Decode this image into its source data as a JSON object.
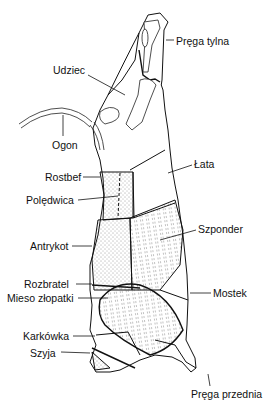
{
  "diagram": {
    "labels": [
      {
        "id": "prega-tylna",
        "text": "Pręga tylna",
        "x": 176,
        "y": 35
      },
      {
        "id": "udziec",
        "text": "Udziec",
        "x": 53,
        "y": 66
      },
      {
        "id": "ogon",
        "text": "Ogon",
        "x": 52,
        "y": 140
      },
      {
        "id": "lata",
        "text": "Łata",
        "x": 194,
        "y": 159
      },
      {
        "id": "rostbef",
        "text": "Rostbef",
        "x": 45,
        "y": 171
      },
      {
        "id": "poledwica",
        "text": "Polędwica",
        "x": 26,
        "y": 195
      },
      {
        "id": "szponder",
        "text": "Szponder",
        "x": 198,
        "y": 224
      },
      {
        "id": "antrykot",
        "text": "Antrykot",
        "x": 30,
        "y": 238
      },
      {
        "id": "rozbratel",
        "text": "Rozbratel",
        "x": 24,
        "y": 279
      },
      {
        "id": "mieso-z-lopatki",
        "text": "Mieso złopatki",
        "x": 7,
        "y": 293
      },
      {
        "id": "mostek",
        "text": "Mostek",
        "x": 213,
        "y": 288
      },
      {
        "id": "karkowka",
        "text": "Karkówka",
        "x": 23,
        "y": 331
      },
      {
        "id": "szyja",
        "text": "Szyja",
        "x": 30,
        "y": 348
      },
      {
        "id": "prega-przednia",
        "text": "Pręga przednia",
        "x": 191,
        "y": 389
      }
    ]
  },
  "colors": {
    "ink": "#111111",
    "background": "#ffffff"
  }
}
